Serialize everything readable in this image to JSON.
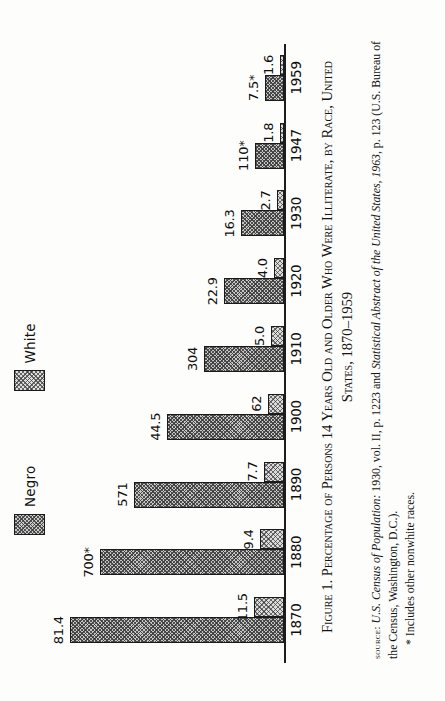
{
  "figure": {
    "caption_label": "Figure 1.",
    "caption_main": "Percentage of Persons 14 Years Old and Older Who Were Illiterate, by Race, United",
    "caption_line2": "States, 1870–1959",
    "source_label": "source:",
    "source_italic_1": "U.S. Census of Population:",
    "source_text_1": " 1930, vol. II, p. 1223 and ",
    "source_italic_2": "Statistical Abstract of the United States, 1963,",
    "source_text_2": " p. 123 (U.S. Bureau of the Census, Washington, D.C.).",
    "footnote": "* Includes other nonwhite races."
  },
  "legend": {
    "items": [
      {
        "label": "Negro",
        "swatch": "hatch-dense-swatch"
      },
      {
        "label": "White",
        "swatch": "hatch-light-swatch"
      }
    ]
  },
  "chart_data": {
    "type": "bar",
    "title": "Percentage of Persons 14 Years Old and Older Who Were Illiterate, by Race, United States, 1870–1959",
    "xlabel": "",
    "ylabel": "",
    "ylim": [
      0,
      85
    ],
    "grid": false,
    "legend_position": "top",
    "orientation": "vertical-bars-rotated-page",
    "categories": [
      "1870",
      "1880",
      "1890",
      "1900",
      "1910",
      "1920",
      "1930",
      "1947",
      "1959"
    ],
    "series": [
      {
        "name": "Negro",
        "values": [
          81.4,
          70.0,
          57.1,
          44.5,
          30.4,
          22.9,
          16.3,
          11.0,
          7.5
        ],
        "labels": [
          "81.4",
          "700*",
          "571",
          "44.5",
          "304",
          "22.9",
          "16.3",
          "110*",
          "7.5*"
        ]
      },
      {
        "name": "White",
        "values": [
          11.5,
          9.4,
          7.7,
          6.2,
          5.0,
          4.0,
          2.7,
          1.8,
          1.6
        ],
        "labels": [
          "11.5",
          "9.4",
          "7.7",
          "62",
          "5.0",
          "4.0",
          "2.7",
          "1.8",
          "1.6"
        ]
      }
    ],
    "annotations": [
      "* Includes other nonwhite races."
    ]
  },
  "colors": {
    "ink": "#141414",
    "bar_negro_fill": "#c7c7c7",
    "bar_white_fill": "#dcdcdc",
    "paper": "#fdfdfb"
  }
}
